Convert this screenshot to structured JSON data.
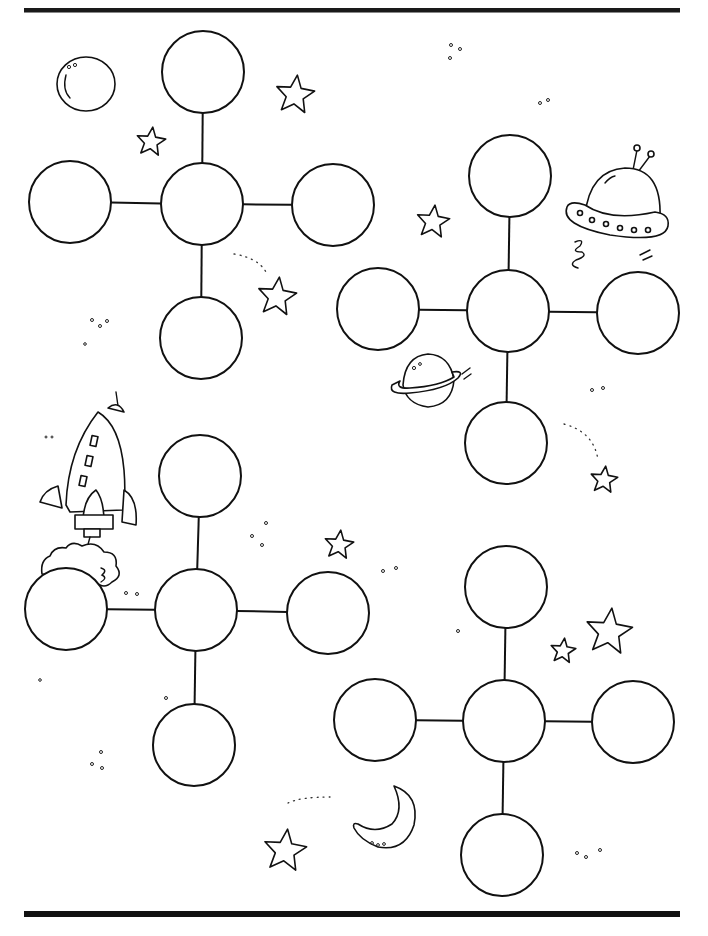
{
  "page": {
    "type": "graphic-organizer-worksheet",
    "theme": "outer-space",
    "ink_color": "#111111",
    "paper_color": "#ffffff"
  },
  "rules": {
    "top": {
      "x1": 24,
      "x2": 680,
      "y": 10
    },
    "bottom": {
      "x1": 24,
      "x2": 680,
      "y": 914
    }
  },
  "webs": [
    {
      "id": "web-1",
      "radius": 41,
      "center": {
        "x": 202,
        "y": 204
      },
      "spokes": {
        "top": {
          "x": 203,
          "y": 72
        },
        "left": {
          "x": 70,
          "y": 202
        },
        "right": {
          "x": 333,
          "y": 205
        },
        "bottom": {
          "x": 201,
          "y": 338
        }
      }
    },
    {
      "id": "web-2",
      "radius": 41,
      "center": {
        "x": 508,
        "y": 311
      },
      "spokes": {
        "top": {
          "x": 510,
          "y": 176
        },
        "left": {
          "x": 378,
          "y": 309
        },
        "right": {
          "x": 638,
          "y": 313
        },
        "bottom": {
          "x": 506,
          "y": 443
        }
      }
    },
    {
      "id": "web-3",
      "radius": 41,
      "center": {
        "x": 196,
        "y": 610
      },
      "spokes": {
        "top": {
          "x": 200,
          "y": 476
        },
        "left": {
          "x": 66,
          "y": 609
        },
        "right": {
          "x": 328,
          "y": 613
        },
        "bottom": {
          "x": 194,
          "y": 745
        }
      }
    },
    {
      "id": "web-4",
      "radius": 41,
      "center": {
        "x": 504,
        "y": 721
      },
      "spokes": {
        "top": {
          "x": 506,
          "y": 587
        },
        "left": {
          "x": 375,
          "y": 720
        },
        "right": {
          "x": 633,
          "y": 722
        },
        "bottom": {
          "x": 502,
          "y": 855
        }
      }
    }
  ],
  "decorations": [
    {
      "icon": "planet-bubble-icon",
      "x": 86,
      "y": 84
    },
    {
      "icon": "star-icon",
      "x": 295,
      "y": 95,
      "size": 20
    },
    {
      "icon": "star-icon",
      "x": 151,
      "y": 142,
      "size": 15
    },
    {
      "icon": "star-icon",
      "x": 277,
      "y": 297,
      "size": 20
    },
    {
      "icon": "star-icon",
      "x": 433,
      "y": 222,
      "size": 17
    },
    {
      "icon": "ufo-icon",
      "x": 615,
      "y": 205
    },
    {
      "icon": "ringed-planet-icon",
      "x": 425,
      "y": 378
    },
    {
      "icon": "star-icon",
      "x": 604,
      "y": 480,
      "size": 14
    },
    {
      "icon": "rocket-icon",
      "x": 90,
      "y": 470
    },
    {
      "icon": "star-icon",
      "x": 339,
      "y": 545,
      "size": 15
    },
    {
      "icon": "star-icon",
      "x": 563,
      "y": 651,
      "size": 13
    },
    {
      "icon": "star-icon",
      "x": 609,
      "y": 632,
      "size": 24
    },
    {
      "icon": "crescent-moon-icon",
      "x": 385,
      "y": 812
    },
    {
      "icon": "star-icon",
      "x": 285,
      "y": 851,
      "size": 22
    }
  ]
}
